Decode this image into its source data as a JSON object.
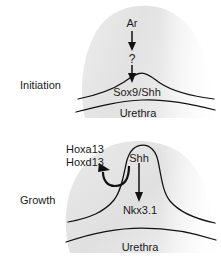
{
  "figure": {
    "background_color": "#ffffff",
    "tissue_fill_color": "#e3e3e3",
    "line_color": "#111111",
    "text_color": "#1a1a1a"
  },
  "panels": [
    {
      "id": "initiation",
      "stage_label": "Initiation",
      "labels": {
        "upstream_signal": "Ar",
        "unknown_mediator": "?",
        "bud_markers": "Sox9/Shh",
        "lumen": "Urethra"
      },
      "arrows": [
        {
          "name": "ar-to-unknown",
          "from": "Ar",
          "to": "?",
          "direction": "down"
        },
        {
          "name": "unknown-to-bud",
          "from": "?",
          "to": "Sox9/Shh",
          "direction": "down"
        }
      ]
    },
    {
      "id": "growth",
      "stage_label": "Growth",
      "labels": {
        "hox_gene_a": "Hoxa13",
        "hox_gene_d": "Hoxd13",
        "bud_signal": "Shh",
        "downstream_target": "Nkx3.1",
        "lumen": "Urethra"
      },
      "arrows": [
        {
          "name": "shh-to-hox",
          "from": "Shh",
          "to": "Hoxd13",
          "direction": "curved-up-left"
        },
        {
          "name": "shh-to-nkx",
          "from": "Shh",
          "to": "Nkx3.1",
          "direction": "down"
        }
      ]
    }
  ]
}
